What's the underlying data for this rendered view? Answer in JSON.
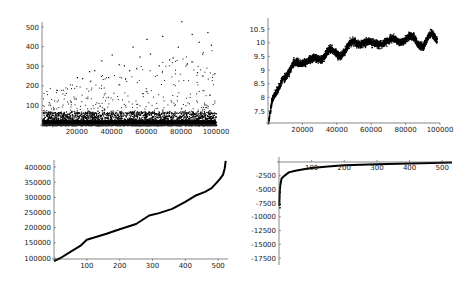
{
  "chart_data": [
    {
      "id": "top-left",
      "type": "scatter",
      "title": "",
      "xlabel": "",
      "ylabel": "",
      "xlim": [
        0,
        100000
      ],
      "ylim": [
        0,
        530
      ],
      "x_ticks": [
        20000,
        40000,
        60000,
        80000,
        100000
      ],
      "y_ticks": [
        100,
        200,
        300,
        400,
        500
      ],
      "grid": false,
      "description": "Dense scatter of ~100000 points; most values below 100, sparse outliers rising to ~530 near x=80000",
      "outliers": [
        [
          20000,
          245
        ],
        [
          23000,
          240
        ],
        [
          27000,
          275
        ],
        [
          30000,
          280
        ],
        [
          34000,
          330
        ],
        [
          38000,
          245
        ],
        [
          40000,
          360
        ],
        [
          44000,
          310
        ],
        [
          47000,
          305
        ],
        [
          50000,
          280
        ],
        [
          52000,
          400
        ],
        [
          56000,
          350
        ],
        [
          60000,
          440
        ],
        [
          62000,
          365
        ],
        [
          67000,
          305
        ],
        [
          69000,
          455
        ],
        [
          73000,
          335
        ],
        [
          75000,
          345
        ],
        [
          78000,
          400
        ],
        [
          80000,
          530
        ],
        [
          83000,
          310
        ],
        [
          86000,
          465
        ],
        [
          89000,
          270
        ],
        [
          90000,
          425
        ],
        [
          92000,
          365
        ],
        [
          95000,
          475
        ],
        [
          97000,
          410
        ],
        [
          99000,
          265
        ]
      ],
      "axis_box": {
        "x0": 42,
        "x1": 216,
        "y0": 125,
        "y1": 22
      }
    },
    {
      "id": "top-right",
      "type": "scatter",
      "title": "",
      "xlabel": "",
      "ylabel": "",
      "xlim": [
        0,
        100000
      ],
      "ylim": [
        7.1,
        10.9
      ],
      "x_ticks": [
        20000,
        40000,
        60000,
        80000,
        100000
      ],
      "y_ticks": [
        7.5,
        8,
        8.5,
        9,
        9.5,
        10,
        10.5
      ],
      "grid": false,
      "description": "Noisy increasing curve: starts ~7.1 at x=0, rises quickly to ~9 by x=10000, ~9.5 by 25000, ~10 by 50000, ~10.2 at 100000",
      "trend": [
        [
          0,
          7.1
        ],
        [
          2000,
          7.8
        ],
        [
          5000,
          8.2
        ],
        [
          8000,
          8.8
        ],
        [
          12000,
          8.9
        ],
        [
          15000,
          9.2
        ],
        [
          20000,
          9.4
        ],
        [
          25000,
          9.3
        ],
        [
          30000,
          9.5
        ],
        [
          35000,
          9.7
        ],
        [
          40000,
          9.6
        ],
        [
          45000,
          9.8
        ],
        [
          50000,
          10.0
        ],
        [
          55000,
          10.1
        ],
        [
          60000,
          9.9
        ],
        [
          65000,
          10.1
        ],
        [
          70000,
          10.0
        ],
        [
          75000,
          10.2
        ],
        [
          80000,
          10.1
        ],
        [
          85000,
          10.2
        ],
        [
          90000,
          9.9
        ],
        [
          95000,
          10.3
        ],
        [
          98000,
          10.2
        ]
      ],
      "axis_box": {
        "x0": 268,
        "x1": 440,
        "y0": 123,
        "y1": 18
      }
    },
    {
      "id": "bottom-left",
      "type": "line",
      "title": "",
      "xlabel": "",
      "ylabel": "",
      "xlim": [
        0,
        530
      ],
      "ylim": [
        90000,
        425000
      ],
      "x_ticks": [
        100,
        200,
        300,
        400,
        500
      ],
      "y_ticks": [
        100000,
        150000,
        200000,
        250000,
        300000,
        350000,
        400000
      ],
      "grid": false,
      "description": "Monotonically increasing sorted curve from ~90000 to ~420000 with sharp rise at the end",
      "points": [
        [
          0,
          90000
        ],
        [
          20,
          100000
        ],
        [
          50,
          120000
        ],
        [
          80,
          140000
        ],
        [
          100,
          160000
        ],
        [
          130,
          170000
        ],
        [
          160,
          180000
        ],
        [
          200,
          195000
        ],
        [
          250,
          212000
        ],
        [
          290,
          240000
        ],
        [
          320,
          248000
        ],
        [
          360,
          262000
        ],
        [
          400,
          285000
        ],
        [
          430,
          305000
        ],
        [
          460,
          318000
        ],
        [
          480,
          330000
        ],
        [
          495,
          348000
        ],
        [
          505,
          360000
        ],
        [
          515,
          375000
        ],
        [
          520,
          395000
        ],
        [
          523,
          420000
        ]
      ],
      "axis_box": {
        "x0": 54,
        "x1": 228,
        "y0": 259,
        "y1": 160
      }
    },
    {
      "id": "bottom-right",
      "type": "line",
      "title": "",
      "xlabel": "",
      "ylabel": "",
      "xlim": [
        0,
        530
      ],
      "ylim": [
        -18500,
        300
      ],
      "x_ticks": [
        100,
        200,
        300,
        400,
        500
      ],
      "y_ticks": [
        -2500,
        -5000,
        -7500,
        -10000,
        -12500,
        -15000,
        -17500
      ],
      "grid": false,
      "description": "Curve rising steeply from ~-8000 near x=0 to ~-2500 by x=10, approaching 0 asymptotically by x=500",
      "points": [
        [
          1,
          -8000
        ],
        [
          2,
          -5500
        ],
        [
          4,
          -4200
        ],
        [
          8,
          -3000
        ],
        [
          15,
          -2600
        ],
        [
          30,
          -1900
        ],
        [
          50,
          -1600
        ],
        [
          80,
          -1300
        ],
        [
          100,
          -1100
        ],
        [
          150,
          -800
        ],
        [
          200,
          -600
        ],
        [
          300,
          -400
        ],
        [
          400,
          -250
        ],
        [
          500,
          -120
        ],
        [
          530,
          -80
        ]
      ],
      "axis_box": {
        "x0": 279,
        "x1": 452,
        "y0": 162,
        "y1": 157
      }
    }
  ]
}
